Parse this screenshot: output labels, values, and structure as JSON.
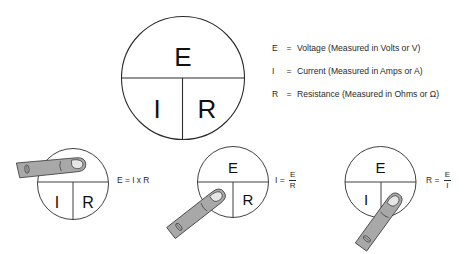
{
  "main_circle": {
    "top_label": "E",
    "bottom_left_label": "I",
    "bottom_right_label": "R"
  },
  "legend": [
    {
      "symbol": "E",
      "equals": "=",
      "description": "Voltage (Measured in Volts or V)"
    },
    {
      "symbol": "I",
      "equals": "=",
      "description": "Current (Measured in Amps or A)"
    },
    {
      "symbol": "R",
      "equals": "=",
      "description": "Resistance (Measured in Ohms or Ω)"
    }
  ],
  "examples": [
    {
      "covered": "E",
      "labels": {
        "left": "I",
        "right": "R"
      },
      "formula": {
        "lhs": "E",
        "equals": "=",
        "rhs": "I x R"
      }
    },
    {
      "covered": "I",
      "labels": {
        "top": "E",
        "right": "R"
      },
      "formula": {
        "lhs": "I",
        "equals": "=",
        "numerator": "E",
        "denominator": "R"
      }
    },
    {
      "covered": "R",
      "labels": {
        "top": "E",
        "left": "I"
      },
      "formula": {
        "lhs": "R",
        "equals": "=",
        "numerator": "E",
        "denominator": "I"
      }
    }
  ],
  "colors": {
    "line": "#2b2b2b",
    "finger_fill": "#a8a8a8",
    "finger_stroke": "#3a3a3a",
    "nail_fill": "#e6e6e6"
  }
}
